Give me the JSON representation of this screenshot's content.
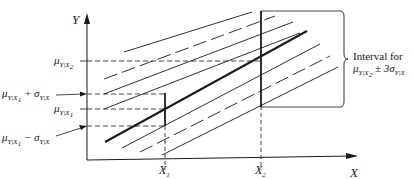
{
  "diagram": {
    "type": "regression-distribution-bands",
    "axes": {
      "y_label": "Y",
      "x_label": "X",
      "x_ticks": [
        "X1",
        "X2"
      ]
    },
    "y_labels": [
      {
        "id": "mu_x2",
        "text": "μY|X2"
      },
      {
        "id": "mu_x1_plus_sigma",
        "text": "μY|X1 + σY|X"
      },
      {
        "id": "mu_x1",
        "text": "μY|X1"
      },
      {
        "id": "mu_x1_minus_sigma",
        "text": "μY|X1 − σY|X"
      }
    ],
    "annotation": {
      "line1": "Interval for",
      "line2": "μY|X2 ± 3σY|X"
    },
    "colors": {
      "ink": "#1a1a1a",
      "background": "#ffffff"
    }
  }
}
